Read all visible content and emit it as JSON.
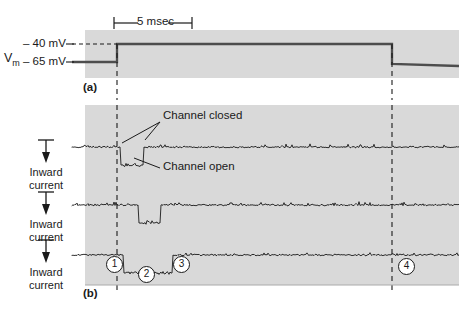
{
  "figure": {
    "background_color": "#ffffff",
    "plot_background_color": "#d9d9d9",
    "trace_color": "#1a1a1a"
  },
  "scale_bar": {
    "label": "5 msec",
    "x_start_px": 114,
    "x_end_px": 192,
    "duration_ms": 5
  },
  "panel_a": {
    "tag": "(a)",
    "y_axis_name": "Vm",
    "y_axis_name_base": "V",
    "y_axis_name_sub": "m",
    "levels": [
      {
        "label": "– 40 mV",
        "value_mv": -40
      },
      {
        "label": "– 65 mV",
        "value_mv": -65
      }
    ],
    "step": {
      "holding_mv": -65,
      "test_mv": -40,
      "onset_px": 117,
      "offset_px": 392
    }
  },
  "panel_b": {
    "tag": "(b)",
    "axis_label": "Inward\ncurrent",
    "axis_label_line1": "Inward",
    "axis_label_line2": "current",
    "arrow_direction": "down",
    "traces": [
      {
        "name": "trace-1",
        "baseline_y": 147,
        "openings": [
          {
            "start_px": 121,
            "end_px": 143,
            "amplitude_px": 18
          }
        ]
      },
      {
        "name": "trace-2",
        "baseline_y": 205,
        "openings": [
          {
            "start_px": 139,
            "end_px": 160,
            "amplitude_px": 18
          }
        ]
      },
      {
        "name": "trace-3",
        "baseline_y": 255,
        "openings": [
          {
            "start_px": 124,
            "end_px": 172,
            "amplitude_px": 18
          }
        ]
      }
    ],
    "annotations": [
      {
        "label": "Channel closed",
        "x": 163,
        "y": 116
      },
      {
        "label": "Channel open",
        "x": 163,
        "y": 166
      }
    ],
    "markers": [
      {
        "label": "1",
        "x": 106,
        "y": 256
      },
      {
        "label": "2",
        "x": 138,
        "y": 266
      },
      {
        "label": "3",
        "x": 173,
        "y": 256
      },
      {
        "label": "4",
        "x": 398,
        "y": 258
      }
    ]
  },
  "chart_data": {
    "type": "line",
    "xlabel": "",
    "ylabel": "",
    "legend": [],
    "grid": false,
    "panels": [
      {
        "id": "a",
        "tag": "(a)",
        "type": "step",
        "ylabel": "Vm",
        "ytick_labels": [
          "– 40 mV",
          "– 65 mV"
        ],
        "ytick_values": [
          -40,
          -65
        ],
        "x": [
          0,
          2.0,
          2.0,
          19.6,
          19.6,
          24.0
        ],
        "y": [
          -65,
          -65,
          -40,
          -40,
          -65,
          -65
        ],
        "units": {
          "x": "msec",
          "y": "mV"
        }
      },
      {
        "id": "b",
        "tag": "(b)",
        "type": "line",
        "ylabel": "Inward current",
        "ytick_labels": [],
        "series": [
          {
            "name": "Trace 1",
            "open_intervals_ms": [
              [
                2.3,
                3.7
              ]
            ],
            "open_amplitude_rel": -1
          },
          {
            "name": "Trace 2",
            "open_intervals_ms": [
              [
                3.5,
                4.8
              ]
            ],
            "open_amplitude_rel": -1
          },
          {
            "name": "Trace 3",
            "open_intervals_ms": [
              [
                2.5,
                5.6
              ]
            ],
            "open_amplitude_rel": -1
          }
        ],
        "annotations": [
          "Channel closed",
          "Channel open"
        ],
        "markers": [
          "1",
          "2",
          "3",
          "4"
        ],
        "units": {
          "x": "msec",
          "y": "pA"
        }
      }
    ]
  }
}
